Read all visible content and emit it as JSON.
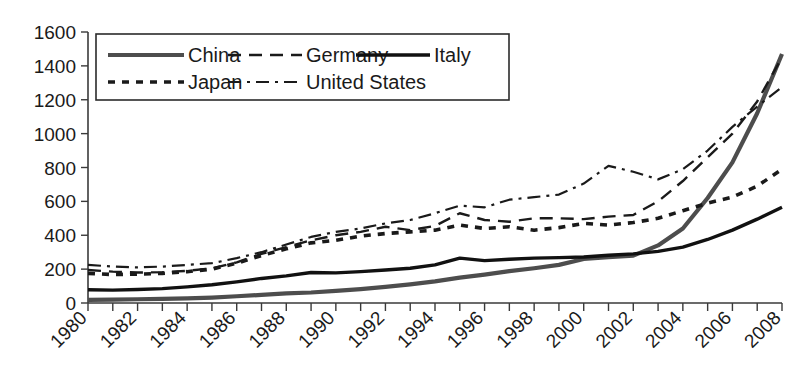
{
  "chart_data": {
    "type": "line",
    "title": "",
    "subtitle": "",
    "xlabel": "",
    "ylabel": "",
    "grid": false,
    "legend_position": "top-left-inside",
    "xlim": [
      1980,
      2008
    ],
    "ylim": [
      0,
      1600
    ],
    "ytick_values": [
      0,
      200,
      400,
      600,
      800,
      1000,
      1200,
      1400,
      1600
    ],
    "ytick_labels": [
      "0",
      "200",
      "400",
      "600",
      "800",
      "1000",
      "1200",
      "1400",
      "1600"
    ],
    "x": [
      1980,
      1981,
      1982,
      1983,
      1984,
      1985,
      1986,
      1987,
      1988,
      1989,
      1990,
      1991,
      1992,
      1993,
      1994,
      1995,
      1996,
      1997,
      1998,
      1999,
      2000,
      2001,
      2002,
      2003,
      2004,
      2005,
      2006,
      2007,
      2008
    ],
    "xtick_values": [
      1980,
      1981,
      1982,
      1983,
      1984,
      1985,
      1986,
      1987,
      1988,
      1989,
      1990,
      1991,
      1992,
      1993,
      1994,
      1995,
      1996,
      1997,
      1998,
      1999,
      2000,
      2001,
      2002,
      2003,
      2004,
      2005,
      2006,
      2007,
      2008
    ],
    "xtick_labels": [
      "1980",
      "",
      "1982",
      "",
      "1984",
      "",
      "1986",
      "",
      "1988",
      "",
      "1990",
      "",
      "1992",
      "",
      "1994",
      "",
      "1996",
      "",
      "1998",
      "",
      "2000",
      "",
      "2002",
      "",
      "2004",
      "",
      "2006",
      "",
      "2008"
    ],
    "xtick_labels_shown": [
      "1980",
      "1982",
      "1984",
      "1986",
      "1988",
      "1990",
      "1992",
      "1994",
      "1996",
      "1998",
      "2000",
      "2002",
      "2004",
      "2006",
      "2008"
    ],
    "series": [
      {
        "name": "China",
        "style": "solid-thick-gray",
        "color": "#4d4d4d",
        "values": [
          18,
          20,
          22,
          24,
          27,
          32,
          40,
          48,
          57,
          62,
          72,
          82,
          95,
          110,
          128,
          150,
          168,
          188,
          205,
          225,
          260,
          270,
          280,
          340,
          440,
          620,
          830,
          1120,
          1470
        ]
      },
      {
        "name": "Germany",
        "style": "dashed",
        "color": "#1a1a1a",
        "values": [
          195,
          185,
          180,
          182,
          190,
          205,
          240,
          290,
          330,
          370,
          400,
          420,
          450,
          430,
          455,
          530,
          490,
          480,
          500,
          500,
          495,
          510,
          520,
          600,
          720,
          860,
          1000,
          1190,
          1450
        ]
      },
      {
        "name": "Italy",
        "style": "solid-thick-black",
        "color": "#111111",
        "values": [
          78,
          76,
          80,
          85,
          95,
          108,
          125,
          145,
          160,
          180,
          178,
          185,
          195,
          205,
          225,
          265,
          250,
          258,
          265,
          268,
          272,
          282,
          290,
          305,
          330,
          375,
          430,
          495,
          565
        ]
      },
      {
        "name": "Japan",
        "style": "dotted",
        "color": "#1a1a1a",
        "values": [
          175,
          168,
          170,
          175,
          185,
          200,
          235,
          280,
          320,
          355,
          370,
          395,
          410,
          420,
          430,
          460,
          440,
          450,
          430,
          445,
          470,
          460,
          475,
          500,
          545,
          590,
          625,
          690,
          790
        ]
      },
      {
        "name": "United States",
        "style": "dash-dot",
        "color": "#1a1a1a",
        "values": [
          225,
          215,
          210,
          215,
          225,
          235,
          265,
          300,
          345,
          390,
          420,
          440,
          470,
          490,
          530,
          575,
          565,
          610,
          625,
          640,
          705,
          810,
          775,
          730,
          790,
          900,
          1040,
          1160,
          1275
        ]
      }
    ]
  },
  "legend": {
    "entries": [
      {
        "label": "China",
        "style": "solid-thick-gray"
      },
      {
        "label": "Germany",
        "style": "dashed"
      },
      {
        "label": "Italy",
        "style": "solid-thick-black"
      },
      {
        "label": "Japan",
        "style": "dotted"
      },
      {
        "label": "United States",
        "style": "dash-dot"
      }
    ]
  }
}
